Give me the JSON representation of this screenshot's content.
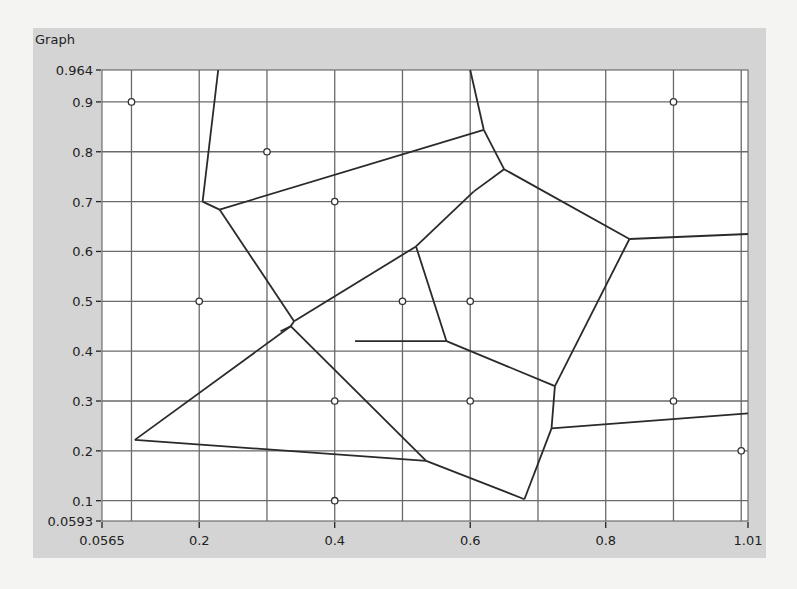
{
  "panel": {
    "title": "Graph"
  },
  "chart_data": {
    "type": "scatter",
    "title": "Graph",
    "subtype": "voronoi-diagram",
    "xlim": [
      0.0565,
      1.01
    ],
    "ylim": [
      0.0593,
      0.964
    ],
    "x_ticks": [
      "0.0565",
      "0.2",
      "0.4",
      "0.6",
      "0.8",
      "1.01"
    ],
    "y_ticks": [
      "0.964",
      "0.9",
      "0.8",
      "0.7",
      "0.6",
      "0.5",
      "0.4",
      "0.3",
      "0.2",
      "0.1",
      "0.0593"
    ],
    "grid_x": [
      0.1,
      0.2,
      0.3,
      0.4,
      0.5,
      0.6,
      0.7,
      0.8,
      0.9,
      1.0
    ],
    "grid_y": [
      0.1,
      0.2,
      0.3,
      0.4,
      0.5,
      0.6,
      0.7,
      0.8,
      0.9
    ],
    "grid": true,
    "sites": [
      {
        "x": 0.1,
        "y": 0.9
      },
      {
        "x": 0.3,
        "y": 0.8
      },
      {
        "x": 0.4,
        "y": 0.7
      },
      {
        "x": 0.2,
        "y": 0.5
      },
      {
        "x": 0.5,
        "y": 0.5
      },
      {
        "x": 0.6,
        "y": 0.5
      },
      {
        "x": 0.4,
        "y": 0.3
      },
      {
        "x": 0.6,
        "y": 0.3
      },
      {
        "x": 0.9,
        "y": 0.9
      },
      {
        "x": 0.9,
        "y": 0.3
      },
      {
        "x": 1.0,
        "y": 0.2
      },
      {
        "x": 0.4,
        "y": 0.1
      }
    ],
    "edges": [
      [
        [
          0.228,
          0.964
        ],
        [
          0.205,
          0.7
        ]
      ],
      [
        [
          0.205,
          0.7
        ],
        [
          0.23,
          0.684
        ]
      ],
      [
        [
          0.23,
          0.684
        ],
        [
          0.62,
          0.844
        ]
      ],
      [
        [
          0.62,
          0.844
        ],
        [
          0.6,
          0.964
        ]
      ],
      [
        [
          0.62,
          0.844
        ],
        [
          0.65,
          0.765
        ]
      ],
      [
        [
          0.65,
          0.765
        ],
        [
          0.605,
          0.72
        ]
      ],
      [
        [
          0.605,
          0.72
        ],
        [
          0.52,
          0.61
        ]
      ],
      [
        [
          0.65,
          0.765
        ],
        [
          0.835,
          0.625
        ]
      ],
      [
        [
          0.835,
          0.625
        ],
        [
          1.01,
          0.635
        ]
      ],
      [
        [
          0.835,
          0.625
        ],
        [
          0.725,
          0.33
        ]
      ],
      [
        [
          0.23,
          0.684
        ],
        [
          0.34,
          0.46
        ]
      ],
      [
        [
          0.34,
          0.46
        ],
        [
          0.335,
          0.45
        ]
      ],
      [
        [
          0.34,
          0.46
        ],
        [
          0.52,
          0.61
        ]
      ],
      [
        [
          0.52,
          0.61
        ],
        [
          0.565,
          0.42
        ]
      ],
      [
        [
          0.565,
          0.42
        ],
        [
          0.725,
          0.33
        ]
      ],
      [
        [
          0.565,
          0.42
        ],
        [
          0.43,
          0.42
        ]
      ],
      [
        [
          0.335,
          0.45
        ],
        [
          0.32,
          0.44
        ]
      ],
      [
        [
          0.335,
          0.45
        ],
        [
          0.105,
          0.222
        ]
      ],
      [
        [
          0.335,
          0.45
        ],
        [
          0.535,
          0.18
        ]
      ],
      [
        [
          0.105,
          0.222
        ],
        [
          0.535,
          0.18
        ]
      ],
      [
        [
          0.535,
          0.18
        ],
        [
          0.68,
          0.103
        ]
      ],
      [
        [
          0.68,
          0.103
        ],
        [
          0.72,
          0.245
        ]
      ],
      [
        [
          0.72,
          0.245
        ],
        [
          0.725,
          0.33
        ]
      ],
      [
        [
          0.72,
          0.245
        ],
        [
          1.01,
          0.275
        ]
      ]
    ],
    "xlabel": "",
    "ylabel": ""
  }
}
